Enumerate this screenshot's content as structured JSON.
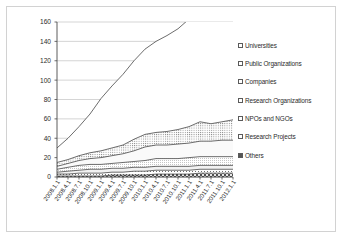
{
  "chart_data": {
    "type": "area",
    "stacked": true,
    "title": "",
    "xlabel": "",
    "ylabel": "",
    "ylim": [
      0,
      160
    ],
    "ytick_step": 20,
    "yticks": [
      0,
      20,
      40,
      60,
      80,
      100,
      120,
      140,
      160
    ],
    "grid": true,
    "grid_axis": "y",
    "legend_position": "right",
    "categories": [
      "2008.1.1",
      "2008.4.1",
      "2008.7.1",
      "2008.10.1",
      "2009.1.1",
      "2009.4.1",
      "2009.7.1",
      "2009.10.1",
      "2010.1.1",
      "2010.4.1",
      "2010.7.1",
      "2010.10.1",
      "2011.1.1",
      "2011.4.1",
      "2011.7.1",
      "2011.10.1",
      "2012.1.1"
    ],
    "series": [
      {
        "name": "Others",
        "fill": "checker-dark",
        "values": [
          1,
          1,
          1,
          1,
          1,
          2,
          2,
          2,
          2,
          3,
          3,
          3,
          3,
          4,
          4,
          4,
          4
        ]
      },
      {
        "name": "Research Projects",
        "fill": "dots-sparse",
        "values": [
          2,
          2,
          3,
          3,
          3,
          3,
          3,
          4,
          4,
          4,
          4,
          4,
          4,
          4,
          4,
          4,
          4
        ]
      },
      {
        "name": "NPOs and NGOs",
        "fill": "solid-light",
        "values": [
          2,
          3,
          3,
          4,
          4,
          4,
          4,
          4,
          4,
          4,
          4,
          4,
          4,
          4,
          4,
          4,
          4
        ]
      },
      {
        "name": "Research Organizations",
        "fill": "dots-fine",
        "values": [
          3,
          4,
          5,
          5,
          5,
          5,
          6,
          6,
          7,
          8,
          8,
          8,
          9,
          9,
          9,
          9,
          9
        ]
      },
      {
        "name": "Companies",
        "fill": "solid-pale",
        "values": [
          3,
          4,
          5,
          6,
          7,
          8,
          9,
          11,
          14,
          14,
          14,
          15,
          15,
          16,
          16,
          17,
          17
        ]
      },
      {
        "name": "Public Organizations",
        "fill": "dots-medium",
        "values": [
          4,
          4,
          5,
          6,
          7,
          8,
          9,
          12,
          13,
          13,
          14,
          15,
          17,
          20,
          18,
          19,
          21
        ]
      },
      {
        "name": "Universities",
        "fill": "solid-white",
        "values": [
          15,
          22,
          30,
          40,
          54,
          64,
          73,
          81,
          88,
          94,
          99,
          104,
          111,
          116,
          110,
          116,
          116
        ]
      }
    ],
    "totals": [
      30,
      40,
      52,
      65,
      81,
      94,
      106,
      120,
      132,
      140,
      146,
      153,
      163,
      173,
      165,
      173,
      175
    ],
    "totals_display": [
      30,
      40,
      52,
      65,
      81,
      94,
      106,
      120,
      132,
      140,
      146,
      153,
      163,
      173,
      165,
      173,
      175
    ]
  },
  "legend": {
    "items": [
      {
        "label": "Universities",
        "swatch": "open"
      },
      {
        "label": "Public Organizations",
        "swatch": "open"
      },
      {
        "label": "Companies",
        "swatch": "open"
      },
      {
        "label": "Research Organizations",
        "swatch": "open"
      },
      {
        "label": "NPOs and NGOs",
        "swatch": "open"
      },
      {
        "label": "Research Projects",
        "swatch": "open"
      },
      {
        "label": "Others",
        "swatch": "filled"
      }
    ]
  },
  "colors": {
    "axis": "#4a4a4a",
    "grid": "#b8b8b8",
    "text": "#2b2b2b",
    "frame": "#d2d2d2",
    "series_line": "#3c3c3c",
    "others_fill": "#555555"
  }
}
